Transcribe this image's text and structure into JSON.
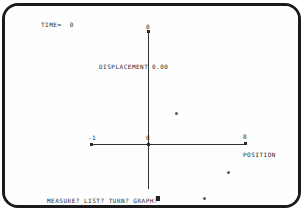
{
  "screen": {
    "time_readout": "TIME=  0",
    "displacement_label": "DISPLACEMENT",
    "displacement_value": "0.00",
    "prompt": "MEASURE? LIST? TURN? GRAPH?",
    "cursor": "block-cursor"
  },
  "chart_data": {
    "type": "scatter",
    "title": "",
    "xlabel": "POSITION",
    "ylabel": "DISPLACEMENT",
    "xlim": [
      -1,
      8
    ],
    "ylim": [
      -4,
      4
    ],
    "grid": false,
    "legend": "none",
    "x_ticks": [
      {
        "label": "-1",
        "value": -1
      },
      {
        "label": "0",
        "value": 0
      },
      {
        "label": "8",
        "value": 8
      }
    ],
    "y_ticks": [
      {
        "label": "0",
        "value": 4
      }
    ],
    "points": [
      {
        "x": 2.3,
        "y": 1.1
      },
      {
        "x": 6.6,
        "y": -1.0
      },
      {
        "x": 4.6,
        "y": -1.9
      }
    ]
  },
  "colors": {
    "bezel": "#1b1b1b",
    "screen": "#fefefe",
    "ink": "#2a2a2a",
    "axis": "#333333",
    "point": "#5d5d5d"
  }
}
